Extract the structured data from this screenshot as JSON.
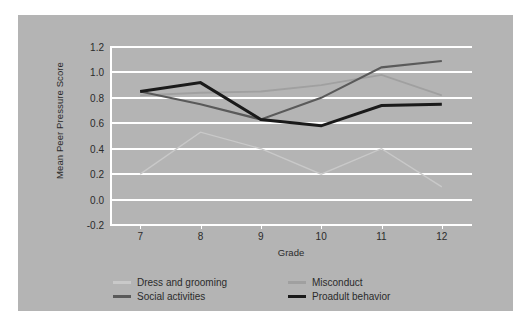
{
  "chart_data": {
    "type": "line",
    "title": "",
    "xlabel": "Grade",
    "ylabel": "Mean Peer Pressure Score",
    "x": [
      7,
      8,
      9,
      10,
      11,
      12
    ],
    "categories": [
      "7",
      "8",
      "9",
      "10",
      "11",
      "12"
    ],
    "xlim": [
      6.5,
      12.5
    ],
    "ylim": [
      -0.2,
      1.2
    ],
    "yticks": [
      "1.2",
      "1.0",
      "0.8",
      "0.6",
      "0.4",
      "0.2",
      "0.0",
      "-0.2"
    ],
    "ytick_values": [
      1.2,
      1.0,
      0.8,
      0.6,
      0.4,
      0.2,
      0.0,
      -0.2
    ],
    "grid": true,
    "grid_color": "#ffffff",
    "background": "#b4b4b4",
    "legend_position": "below-plot",
    "series": [
      {
        "name": "Dress and grooming",
        "color": "#c9c9c9",
        "width": 1.4,
        "values": [
          0.2,
          0.53,
          0.4,
          0.2,
          0.4,
          0.1
        ]
      },
      {
        "name": "Misconduct",
        "color": "#a0a0a0",
        "width": 1.8,
        "values": [
          0.82,
          0.84,
          0.85,
          0.9,
          0.98,
          0.82
        ]
      },
      {
        "name": "Social activities",
        "color": "#5a5a5a",
        "width": 2.2,
        "values": [
          0.85,
          0.75,
          0.63,
          0.8,
          1.04,
          1.09
        ]
      },
      {
        "name": "Proadult behavior",
        "color": "#1a1a1a",
        "width": 3.0,
        "values": [
          0.85,
          0.92,
          0.63,
          0.58,
          0.74,
          0.75
        ]
      }
    ]
  },
  "legend": {
    "entries": [
      {
        "label": "Dress and grooming",
        "color": "#c9c9c9",
        "col": 0,
        "row": 0
      },
      {
        "label": "Misconduct",
        "color": "#a0a0a0",
        "col": 1,
        "row": 0
      },
      {
        "label": "Social activities",
        "color": "#5a5a5a",
        "col": 0,
        "row": 1
      },
      {
        "label": "Proadult behavior",
        "color": "#1a1a1a",
        "col": 1,
        "row": 1
      }
    ]
  }
}
